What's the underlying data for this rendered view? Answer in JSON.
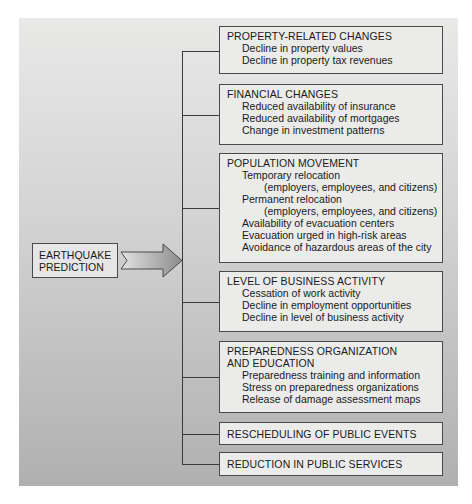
{
  "diagram": {
    "source": {
      "line1": "EARTHQUAKE",
      "line2": "PREDICTION"
    },
    "arrow": {
      "direction": "right",
      "fill_light": "#e0e0e0",
      "fill_dark": "#8a8a8a"
    },
    "categories": [
      {
        "title": "PROPERTY-RELATED CHANGES",
        "items": [
          {
            "text": "Decline in property values"
          },
          {
            "text": "Decline in property tax revenues"
          }
        ]
      },
      {
        "title": "FINANCIAL CHANGES",
        "items": [
          {
            "text": "Reduced availability of insurance"
          },
          {
            "text": "Reduced availability of mortgages"
          },
          {
            "text": "Change in investment patterns"
          }
        ]
      },
      {
        "title": "POPULATION MOVEMENT",
        "items": [
          {
            "text": "Temporary relocation"
          },
          {
            "text": "(employers, employees, and citizens)"
          },
          {
            "text": "Permanent relocation"
          },
          {
            "text": "(employers, employees, and citizens)"
          },
          {
            "text": "Availability of evacuation centers"
          },
          {
            "text": "Evacuation urged in high-risk areas"
          },
          {
            "text": "Avoidance of hazardous areas of the city"
          }
        ]
      },
      {
        "title": "LEVEL OF BUSINESS ACTIVITY",
        "items": [
          {
            "text": "Cessation of work activity"
          },
          {
            "text": "Decline in employment opportunities"
          },
          {
            "text": "Decline in level of business activity"
          }
        ]
      },
      {
        "title_line1": "PREPAREDNESS ORGANIZATION",
        "title_line2": "AND EDUCATION",
        "items": [
          {
            "text": "Preparedness training and information"
          },
          {
            "text": "Stress on preparedness organizations"
          },
          {
            "text": "Release of damage assessment maps"
          }
        ]
      },
      {
        "title": "RESCHEDULING OF PUBLIC EVENTS"
      },
      {
        "title": "REDUCTION IN PUBLIC SERVICES"
      }
    ]
  },
  "colors": {
    "panel_top": "#e9e9e8",
    "panel_bottom": "#b0b0b0",
    "box_fill": "#ebebea",
    "box_border": "#4a4a4a",
    "connector": "#3a3a3a"
  }
}
